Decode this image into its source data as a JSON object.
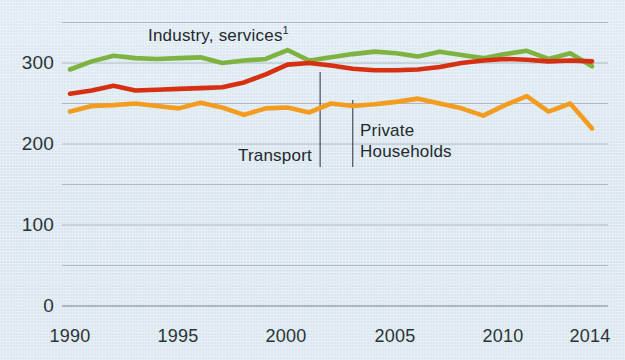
{
  "chart_data": {
    "type": "line",
    "title": "",
    "subtitle": "",
    "xlabel": "",
    "ylabel": "",
    "xlim": [
      1990,
      2014
    ],
    "ylim": [
      0,
      350
    ],
    "grid": true,
    "grid_values": [
      0,
      50,
      100,
      150,
      200,
      250,
      300,
      350
    ],
    "legend_position": "inline-annotations",
    "x": [
      1990,
      1991,
      1992,
      1993,
      1994,
      1995,
      1996,
      1997,
      1998,
      1999,
      2000,
      2001,
      2002,
      2003,
      2004,
      2005,
      2006,
      2007,
      2008,
      2009,
      2010,
      2011,
      2012,
      2013,
      2014
    ],
    "xticks": [
      1990,
      1995,
      2000,
      2005,
      2010,
      2014
    ],
    "xtick_labels": [
      "1990",
      "1995",
      "2000",
      "2005",
      "2010",
      "2014"
    ],
    "yticks": [
      0,
      100,
      200,
      300
    ],
    "ytick_labels": [
      "0",
      "100",
      "200",
      "300"
    ],
    "series": [
      {
        "name": "Industry, services",
        "label": "Industry, services",
        "superscript": "1",
        "color": "#7fb341",
        "values": [
          292,
          302,
          309,
          306,
          305,
          306,
          307,
          300,
          303,
          305,
          316,
          303,
          307,
          311,
          314,
          312,
          308,
          314,
          310,
          306,
          311,
          315,
          305,
          312,
          296
        ]
      },
      {
        "name": "Transport",
        "label": "Transport",
        "color": "#d62f12",
        "values": [
          262,
          266,
          272,
          266,
          267,
          268,
          269,
          270,
          276,
          286,
          298,
          300,
          297,
          293,
          291,
          291,
          292,
          295,
          300,
          303,
          305,
          304,
          302,
          303,
          302
        ]
      },
      {
        "name": "Private Households",
        "label": "Private Households",
        "color": "#f39c1f",
        "values": [
          240,
          247,
          248,
          250,
          247,
          244,
          251,
          245,
          236,
          244,
          245,
          239,
          250,
          247,
          249,
          252,
          256,
          250,
          244,
          235,
          248,
          259,
          240,
          250,
          219
        ]
      }
    ],
    "annotations": [
      {
        "text": "Industry, services",
        "superscript": "1",
        "x": 1997
      },
      {
        "text": "Transport",
        "leader_year": 2001.5
      },
      {
        "text": "Private Households",
        "leader_year": 2003.0
      }
    ]
  }
}
